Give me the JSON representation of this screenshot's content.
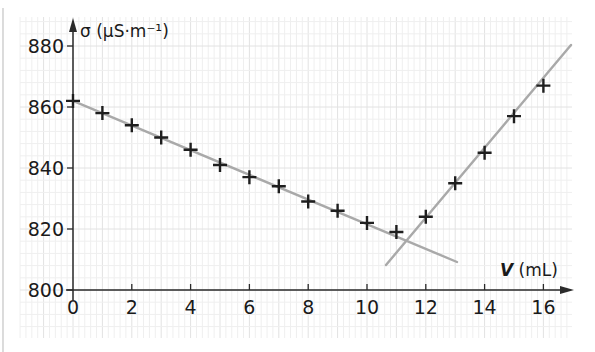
{
  "chart_data": {
    "type": "scatter",
    "title": "",
    "xlabel": "V (mL)",
    "xlabel_var": "V",
    "xlabel_unit": "(mL)",
    "ylabel": "σ (µS·m⁻¹)",
    "xlim": [
      0,
      17
    ],
    "ylim": [
      800,
      885
    ],
    "x_ticks": [
      0,
      2,
      4,
      6,
      8,
      10,
      12,
      14,
      16
    ],
    "y_ticks": [
      800,
      820,
      840,
      860,
      880
    ],
    "grid": true,
    "legend": null,
    "series": [
      {
        "name": "measurements",
        "marker": "plus",
        "x": [
          0,
          1,
          2,
          3,
          4,
          5,
          6,
          7,
          8,
          9,
          10,
          11,
          12,
          13,
          14,
          15,
          16
        ],
        "y": [
          862,
          858,
          854,
          850,
          846,
          841,
          837,
          834,
          829,
          826,
          822,
          819,
          824,
          835,
          845,
          857,
          867
        ]
      }
    ],
    "fit_lines": [
      {
        "name": "decreasing-fit",
        "x": [
          0,
          13
        ],
        "y": [
          862,
          809
        ]
      },
      {
        "name": "increasing-fit",
        "x": [
          10.7,
          17
        ],
        "y": [
          808,
          880
        ]
      }
    ],
    "annotations": []
  },
  "axes": {
    "x_ticks": [
      "0",
      "2",
      "4",
      "6",
      "8",
      "10",
      "12",
      "14",
      "16"
    ],
    "y_ticks": [
      "800",
      "820",
      "840",
      "860",
      "880"
    ],
    "y_title": "σ (µS·m⁻¹)",
    "x_title_var": "V",
    "x_title_unit": " (mL)"
  },
  "colors": {
    "axis": "#2a2a2a",
    "marker": "#1e1e1e",
    "fit_line": "#a9a9a9",
    "grid_minor": "#efefef",
    "grid_major": "#e2e2e2",
    "frame": "#bdbdbd"
  }
}
